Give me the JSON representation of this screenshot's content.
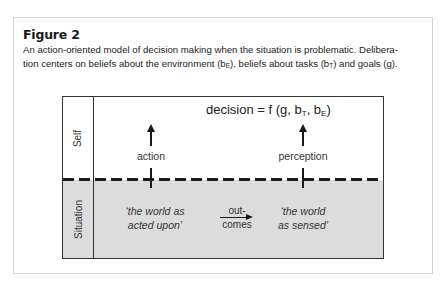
{
  "figure": {
    "title": "Figure 2",
    "caption_line1": "An action-oriented model of decision making when the situation is problematic. Delibera-",
    "caption_line2_a": "tion centers on beliefs about the environment (b",
    "caption_line2_sub1": "E",
    "caption_line2_b": "), beliefs about tasks (b",
    "caption_line2_sub2": "T",
    "caption_line2_c": ") and goals (g)."
  },
  "diagram": {
    "rows": [
      {
        "label": "Self"
      },
      {
        "label": "Situation"
      }
    ],
    "decision": {
      "prefix": "decision = f (g, b",
      "sub1": "T",
      "mid": ", b",
      "sub2": "E",
      "suffix": ")"
    },
    "arrows": [
      {
        "label": "action"
      },
      {
        "label": "perception"
      }
    ],
    "world_acted": {
      "line1": "‘the world as",
      "line2": "acted upon’"
    },
    "world_sensed": {
      "line1": "‘the world",
      "line2": "as sensed’"
    },
    "outcomes": {
      "line1": "out-",
      "line2": "comes"
    },
    "colors": {
      "situation_fill": "#dcdcdc",
      "line": "#1a1a1a"
    }
  }
}
